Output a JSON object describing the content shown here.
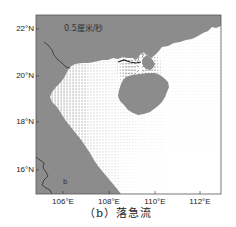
{
  "figure": {
    "caption": "（b）落急流",
    "map_annotation": "0.5厘米/秒",
    "panel_letter": "b"
  },
  "axes": {
    "lat_ticks": [
      "22°N",
      "20°N",
      "18°N",
      "16°N"
    ],
    "lon_ticks": [
      "106°E",
      "108°E",
      "110°E",
      "112°E"
    ],
    "lat_range_deg": [
      15,
      22.7
    ],
    "lon_range_deg": [
      105,
      113.3
    ]
  },
  "colors": {
    "land": "#8c8c8c",
    "sea": "#ffffff",
    "vectors": "#1a1a1a",
    "frame": "#555555",
    "river": "#222222"
  },
  "chart_data": {
    "type": "vector-field",
    "title": "（b）落急流",
    "xlabel": "",
    "ylabel": "",
    "x_ticks": [
      "106°E",
      "108°E",
      "110°E",
      "112°E"
    ],
    "y_ticks": [
      "16°N",
      "18°N",
      "20°N",
      "22°N"
    ]
  }
}
